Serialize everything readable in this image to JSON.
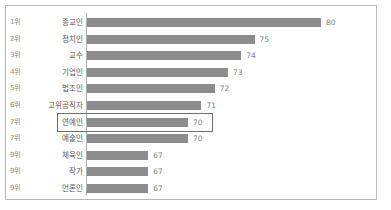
{
  "chart_data": {
    "type": "bar",
    "orientation": "horizontal",
    "title": "",
    "subtitle": "",
    "xlabel": "",
    "ylabel": "",
    "grid": false,
    "legend": null,
    "axis_origin_value": 62.4,
    "xlim": [
      62.4,
      81.5
    ],
    "categories": [
      "종교인",
      "정치인",
      "교수",
      "기업인",
      "법조인",
      "고위공직자",
      "연예인",
      "예술인",
      "체육인",
      "작가",
      "언론인"
    ],
    "ranks": [
      "1위",
      "2위",
      "3위",
      "4위",
      "5위",
      "6위",
      "7위",
      "7위",
      "9위",
      "9위",
      "9위"
    ],
    "values": [
      80,
      75,
      74,
      73,
      72,
      71,
      70,
      70,
      67,
      67,
      67
    ],
    "value_labels": [
      "80",
      "75",
      "74",
      "73",
      "72",
      "71",
      "70",
      "70",
      "67",
      "67",
      "67"
    ],
    "highlighted_index": 6,
    "bar_color": "#8c8c8c",
    "highlight_border_color": "#6e6e6e",
    "frame_border_color": "#b9b9b9",
    "axis_line_color": "#aeaeae",
    "rank_text_color": "#8a8a8a",
    "category_text_color": "#595959",
    "value_text_color": "#7d7d7d"
  }
}
